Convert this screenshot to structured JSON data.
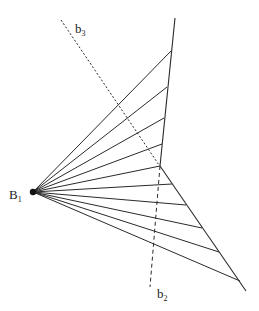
{
  "diagram": {
    "colors": {
      "line": "#2a2a2a",
      "dashed": "#2a2a2a",
      "point": "#111111",
      "background": "#ffffff"
    },
    "labels": {
      "origin": {
        "main": "B",
        "sub": "1"
      },
      "bisector_upper": {
        "main": "b",
        "sub": "3"
      },
      "bisector_lower": {
        "main": "b",
        "sub": "2"
      }
    },
    "ray_counts": {
      "upper_segment": 5,
      "lower_segment": 5
    }
  }
}
